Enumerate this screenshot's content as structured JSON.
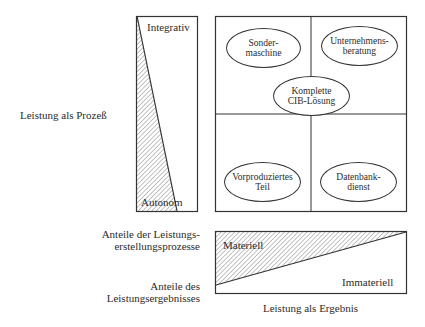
{
  "diagram": {
    "labels": {
      "process_axis": "Leistung als Prozeß",
      "result_axis": "Leistung als Ergebnis",
      "process_shares": [
        "Anteile der Leistungs-",
        "erstellungsprozesse"
      ],
      "result_shares": [
        "Anteile des",
        "Leistungsergebnisses"
      ]
    },
    "process_bar": {
      "top_label": "Integrativ",
      "bottom_label": "Autonom"
    },
    "result_bar": {
      "left_label": "Materiell",
      "right_label": "Immateriell"
    },
    "ellipses": [
      {
        "id": "sondermaschine",
        "lines": [
          "Sonder-",
          "maschine"
        ]
      },
      {
        "id": "unternehmensberatung",
        "lines": [
          "Unternehmens-",
          "beratung"
        ]
      },
      {
        "id": "cib-loesung",
        "lines": [
          "Komplette",
          "CIB-Lösung"
        ]
      },
      {
        "id": "vorproduziertes-teil",
        "lines": [
          "Vorproduziertes",
          "Teil"
        ]
      },
      {
        "id": "datenbankdienst",
        "lines": [
          "Datenbank-",
          "dienst"
        ]
      }
    ],
    "colors": {
      "line": "#333333",
      "hatch": "#555555",
      "background": "#ffffff"
    }
  }
}
